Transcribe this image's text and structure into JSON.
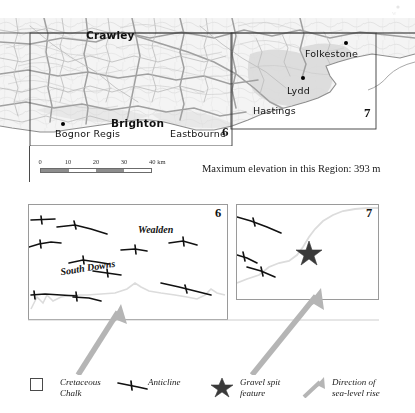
{
  "figure": {
    "top_map": {
      "title": "",
      "places": [
        {
          "name": "Crawley",
          "style": "major",
          "x": 86,
          "y": 29,
          "dot": false
        },
        {
          "name": "Brighton",
          "style": "major",
          "x": 111,
          "y": 117,
          "dot": false
        },
        {
          "name": "Bognor Regis",
          "style": "minor",
          "x": 55,
          "y": 130,
          "dot": true,
          "dot_x": 61,
          "dot_y": 122
        },
        {
          "name": "Eastbourne",
          "style": "minor",
          "x": 170,
          "y": 130,
          "dot": false
        },
        {
          "name": "Hastings",
          "style": "minor",
          "x": 253,
          "y": 108,
          "dot": false
        },
        {
          "name": "Lydd",
          "style": "minor",
          "x": 287,
          "y": 90,
          "dot": true,
          "dot_x": 301,
          "dot_y": 76
        },
        {
          "name": "Folkestone",
          "style": "minor",
          "x": 305,
          "y": 54,
          "dot": true,
          "dot_x": 344,
          "dot_y": 42
        }
      ],
      "box_labels": [
        {
          "text": "6",
          "x": 222,
          "y": 124
        },
        {
          "text": "7",
          "x": 366,
          "y": 107
        }
      ]
    },
    "scale_bar": {
      "ticks": [
        "0",
        "10",
        "20",
        "30",
        "40 km"
      ],
      "unit": "km",
      "max_km": 40
    },
    "elevation_note": "Maximum elevation in this Region: 393 m",
    "panel_6": {
      "number": "6",
      "region_labels": [
        {
          "text": "Wealden",
          "x": 112,
          "y": 22
        },
        {
          "text": "South Downs",
          "x": 36,
          "y": 60
        }
      ]
    },
    "panel_7": {
      "number": "7",
      "region_labels": []
    },
    "legend": {
      "items": [
        {
          "symbol": "chalk-square-symbol",
          "label_line1": "Cretaceous",
          "label_line2": "Chalk"
        },
        {
          "symbol": "anticline-symbol",
          "label_line1": "Anticline",
          "label_line2": ""
        },
        {
          "symbol": "star-symbol",
          "label_line1": "Gravel spit",
          "label_line2": "feature"
        },
        {
          "symbol": "grey-arrow-symbol",
          "label_line1": "Direction of",
          "label_line2": "sea-level rise"
        }
      ]
    },
    "colors": {
      "chalk_fill": "#d8d8d8",
      "relief_light": "#f2f2f2",
      "line_dark": "#111111",
      "box_border": "#9a9a9a",
      "sea_arrow": "#b8b8b8",
      "coastline": "#d9d9d9",
      "scalebar_fill": "#8d8d8d"
    }
  }
}
